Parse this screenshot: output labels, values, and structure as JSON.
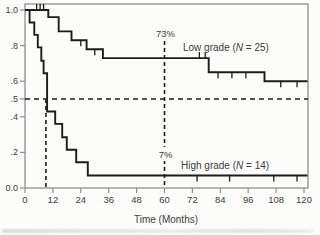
{
  "figure": {
    "background": "#fcfcfa",
    "frame_color": "#8f8f8f",
    "curve_color": "#1c1c1c",
    "dashed_color": "#1c1c1c",
    "text_color": "#3c3c3c"
  },
  "chart_data": {
    "type": "line",
    "subtype": "kaplan-meier-step",
    "title": "",
    "xlabel": "Time (Months)",
    "ylabel": "",
    "xlim": [
      0,
      120
    ],
    "ylim": [
      0,
      1
    ],
    "grid": false,
    "x_ticks": [
      0,
      12,
      24,
      36,
      48,
      60,
      72,
      84,
      96,
      108,
      120
    ],
    "y_ticks": [
      {
        "value": 1.0,
        "label": "1.0"
      },
      {
        "value": 0.8,
        "label": ".8"
      },
      {
        "value": 0.6,
        "label": ".6"
      },
      {
        "value": 0.5,
        "label": ".5"
      },
      {
        "value": 0.4,
        "label": ".4"
      },
      {
        "value": 0.2,
        "label": ".2"
      },
      {
        "value": 0.0,
        "label": "0.0"
      }
    ],
    "reference_level": 0.5,
    "series": [
      {
        "id": "low-grade",
        "label_prefix": "Low grade (",
        "label_n_symbol": "N",
        "label_suffix": " = 25)",
        "n": 25,
        "survival_at_60_months_label": "73%",
        "steps": [
          [
            0,
            1.0
          ],
          [
            10,
            0.96
          ],
          [
            14.5,
            0.88
          ],
          [
            20,
            0.83
          ],
          [
            26.5,
            0.78
          ],
          [
            33.5,
            0.73
          ],
          [
            79,
            0.65
          ],
          [
            103,
            0.6
          ],
          [
            121.5,
            0.6
          ]
        ],
        "censor_marks": [
          {
            "t": 5,
            "v": 1.0,
            "dir": "up"
          },
          {
            "t": 6.5,
            "v": 1.0,
            "dir": "up"
          },
          {
            "t": 8,
            "v": 1.0,
            "dir": "up"
          },
          {
            "t": 24,
            "v": 0.83,
            "dir": "down"
          },
          {
            "t": 30,
            "v": 0.78,
            "dir": "down"
          },
          {
            "t": 75,
            "v": 0.73,
            "dir": "up"
          },
          {
            "t": 77.5,
            "v": 0.73,
            "dir": "up"
          },
          {
            "t": 83,
            "v": 0.65,
            "dir": "down"
          },
          {
            "t": 89,
            "v": 0.65,
            "dir": "down"
          },
          {
            "t": 95,
            "v": 0.65,
            "dir": "down"
          },
          {
            "t": 110,
            "v": 0.6,
            "dir": "down"
          },
          {
            "t": 117,
            "v": 0.6,
            "dir": "down"
          }
        ]
      },
      {
        "id": "high-grade",
        "label_prefix": "High grade (",
        "label_n_symbol": "N",
        "label_suffix": " = 14)",
        "n": 14,
        "survival_at_60_months_label": "7%",
        "median_months": 9,
        "steps": [
          [
            0,
            1.0
          ],
          [
            2,
            0.93
          ],
          [
            4,
            0.86
          ],
          [
            5.5,
            0.79
          ],
          [
            7,
            0.715
          ],
          [
            8,
            0.645
          ],
          [
            9.5,
            0.43
          ],
          [
            13,
            0.36
          ],
          [
            16,
            0.285
          ],
          [
            18,
            0.215
          ],
          [
            22,
            0.145
          ],
          [
            27,
            0.07
          ],
          [
            121.5,
            0.07
          ]
        ],
        "censor_marks": [
          {
            "t": 74,
            "v": 0.07,
            "dir": "down"
          },
          {
            "t": 88,
            "v": 0.07,
            "dir": "down"
          },
          {
            "t": 107,
            "v": 0.07,
            "dir": "down"
          },
          {
            "t": 117,
            "v": 0.07,
            "dir": "down"
          }
        ]
      }
    ],
    "annotations": {
      "pct_line_months": 60,
      "low_grade_pct": "73%",
      "high_grade_pct": "7%",
      "median_line_months": 9
    }
  }
}
